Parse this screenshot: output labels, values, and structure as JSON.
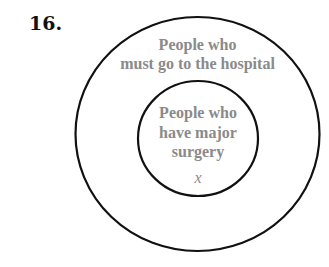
{
  "problem": {
    "number": "16."
  },
  "diagram": {
    "type": "nested-venn",
    "outer_set": {
      "label_line1": "People who",
      "label_line2": "must go to the hospital"
    },
    "inner_set": {
      "label_line1": "People who",
      "label_line2": "have major",
      "label_line3": "surgery",
      "element": "x"
    },
    "colors": {
      "stroke": "#111111",
      "label": "#8a8a8a"
    }
  }
}
